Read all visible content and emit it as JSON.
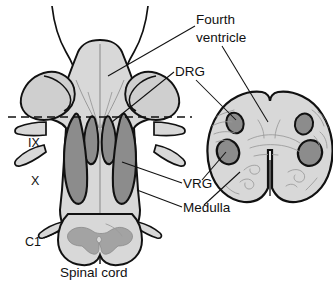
{
  "figure": {
    "name": "brainstem-respiratory-groups-diagram",
    "caption": "Spinal cord",
    "panels": [
      {
        "id": "dorsal-view",
        "name": "Dorsal view of medulla and spinal cord"
      },
      {
        "id": "cross-section",
        "name": "Transverse section of medulla"
      }
    ]
  },
  "labels": {
    "fourth_ventricle_line1": "Fourth",
    "fourth_ventricle_line2": "ventricle",
    "drg": "DRG",
    "vrg": "VRG",
    "medulla": "Medulla",
    "nerve_ix": "IX",
    "nerve_x": "X",
    "c1": "C1",
    "spinal_cord": "Spinal cord"
  },
  "colors": {
    "outline": "#111111",
    "tissue_light": "#d8d8d8",
    "tissue_mid": "#c9c9c9",
    "nucleus_dark": "#8c8c8c",
    "gray_matter": "#a3a3a3",
    "tracery": "#9a9a9a",
    "background": "#ffffff",
    "text": "#111111"
  },
  "structures": {
    "dorsal": {
      "dashed_section_line": "transverse section level",
      "columns": [
        {
          "name": "drg-left",
          "type": "dorsal respiratory group"
        },
        {
          "name": "drg-right",
          "type": "dorsal respiratory group"
        },
        {
          "name": "vrg-left",
          "type": "ventral respiratory group"
        },
        {
          "name": "vrg-right",
          "type": "ventral respiratory group"
        }
      ],
      "rootlets": [
        "IX-left",
        "IX-right",
        "X-left",
        "X-right",
        "C1-left",
        "C1-right"
      ]
    },
    "section": {
      "nuclei": [
        "drg-left",
        "drg-right",
        "vrg-left",
        "vrg-right"
      ]
    }
  }
}
